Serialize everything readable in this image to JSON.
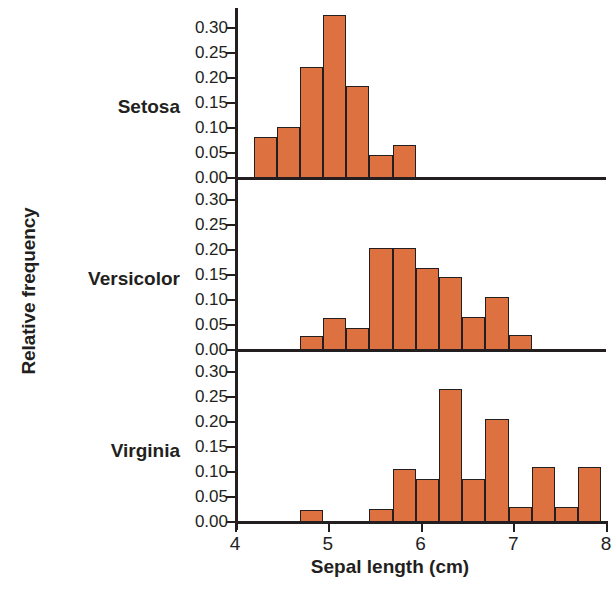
{
  "chart_data": {
    "type": "bar",
    "title": "",
    "xlabel": "Sepal length (cm)",
    "ylabel": "Relative frequency",
    "xlim": [
      4.0,
      8.0
    ],
    "ylim": [
      0.0,
      0.335
    ],
    "bin_width": 0.25,
    "grid": false,
    "legend": "none",
    "bar_color": "#dd7140",
    "bar_edge_color": "#231f20",
    "axis_color": "#231f20",
    "xticks": [
      4,
      5,
      6,
      7,
      8
    ],
    "xticklabels": [
      "4",
      "5",
      "6",
      "7",
      "8"
    ],
    "yticks": [
      0.0,
      0.05,
      0.1,
      0.15,
      0.2,
      0.25,
      0.3
    ],
    "yticklabels": [
      "0.00",
      "0.05",
      "0.10",
      "0.15",
      "0.20",
      "0.25",
      "0.30"
    ],
    "panels": [
      {
        "label": "Setosa",
        "bins_left": [
          4.2,
          4.45,
          4.7,
          4.95,
          5.2,
          5.45,
          5.7
        ],
        "values": [
          0.082,
          0.102,
          0.222,
          0.325,
          0.184,
          0.045,
          0.065
        ]
      },
      {
        "label": "Versicolor",
        "bins_left": [
          4.7,
          4.95,
          5.2,
          5.45,
          5.7,
          5.95,
          6.2,
          6.45,
          6.7,
          6.95
        ],
        "values": [
          0.028,
          0.063,
          0.044,
          0.204,
          0.204,
          0.164,
          0.146,
          0.066,
          0.105,
          0.03
        ]
      },
      {
        "label": "Virginia",
        "bins_left": [
          4.7,
          5.45,
          5.7,
          5.95,
          6.2,
          6.45,
          6.7,
          6.95,
          7.2,
          7.45,
          7.7
        ],
        "values": [
          0.024,
          0.026,
          0.105,
          0.085,
          0.265,
          0.086,
          0.205,
          0.03,
          0.109,
          0.03,
          0.11
        ]
      }
    ]
  }
}
